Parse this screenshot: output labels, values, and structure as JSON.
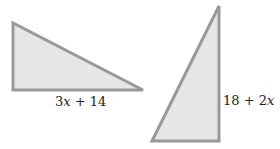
{
  "diagram": {
    "colors": {
      "fill": "#e6e6e6",
      "stroke": "#999999",
      "text": "#222222"
    },
    "triangles": [
      {
        "id": "left-triangle",
        "points": "13,23 13,90 143,90",
        "label": {
          "num": "3",
          "var": "x",
          "rest": " + 14",
          "x": 55,
          "y": 106
        }
      },
      {
        "id": "right-triangle",
        "points": "219,6 219,141 152,141",
        "label": {
          "num": "18 + 2",
          "var": "x",
          "rest": "",
          "x": 223,
          "y": 105
        }
      }
    ]
  }
}
